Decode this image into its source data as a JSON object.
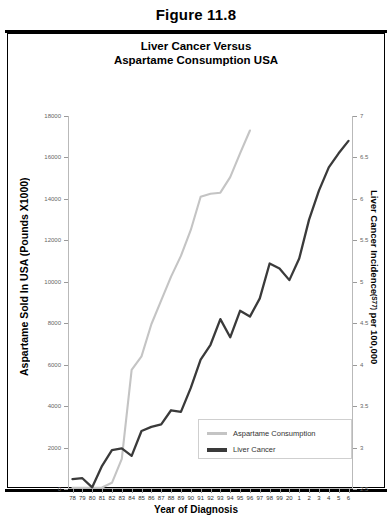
{
  "figure": {
    "number_label": "Figure 11.8"
  },
  "chart_data": {
    "type": "line",
    "title": "Liver Cancer Versus\nAspartame Consumption USA",
    "title_line1": "Liver Cancer Versus",
    "title_line2": "Aspartame Consumption USA",
    "xlabel": "Year of Diagnosis",
    "ylabel_left": "Aspartame Sold In USA (Pounds X1000)",
    "ylabel_right_main": "Liver Cancer Incidence",
    "ylabel_right_sub": "(S77)",
    "ylabel_right_tail": " per 100,000",
    "grid": false,
    "legend_position": "inside-bottom-right",
    "categories": [
      "78",
      "79",
      "80",
      "81",
      "82",
      "83",
      "84",
      "85",
      "86",
      "87",
      "88",
      "89",
      "90",
      "91",
      "92",
      "93",
      "94",
      "95",
      "96",
      "97",
      "98",
      "99",
      "20",
      "1",
      "2",
      "3",
      "4",
      "5",
      "6"
    ],
    "x_tick_labels": [
      "78",
      "79",
      "80",
      "81",
      "82",
      "83",
      "84",
      "85",
      "86",
      "87",
      "88",
      "89",
      "90",
      "91",
      "92",
      "93",
      "94",
      "95",
      "96",
      "97",
      "98",
      "99",
      "20",
      "1",
      "2",
      "3",
      "4",
      "5",
      "6"
    ],
    "y_left_ticks": [
      "0",
      "2000",
      "4000",
      "6000",
      "8000",
      "10000",
      "12000",
      "14000",
      "16000",
      "18000"
    ],
    "y_left_lim": [
      0,
      18000
    ],
    "y_right_ticks": [
      "2.5",
      "3",
      "3.5",
      "4",
      "4.5",
      "5",
      "5.5",
      "6",
      "6.5",
      "7"
    ],
    "y_right_lim": [
      2.5,
      7
    ],
    "series": [
      {
        "name": "Aspartame Consumption",
        "color": "#c4c4c4",
        "axis": "left",
        "values": [
          60,
          60,
          60,
          70,
          300,
          1450,
          5750,
          6400,
          7950,
          9100,
          10250,
          11250,
          12500,
          14100,
          14250,
          14300,
          15050,
          16200,
          17300,
          null,
          null,
          null,
          null,
          null,
          null,
          null,
          null,
          null,
          null
        ]
      },
      {
        "name": "Liver Cancer",
        "color": "#3a3a3a",
        "axis": "right",
        "values": [
          2.62,
          2.63,
          2.52,
          2.78,
          2.97,
          2.99,
          2.9,
          3.2,
          3.25,
          3.28,
          3.45,
          3.43,
          3.72,
          4.06,
          4.24,
          4.55,
          4.33,
          4.65,
          4.58,
          4.8,
          5.22,
          5.16,
          5.02,
          5.28,
          5.75,
          6.1,
          6.38,
          6.55,
          6.7
        ]
      }
    ]
  },
  "legend": {
    "items": [
      {
        "label": "Aspartame Consumption",
        "color": "#c4c4c4"
      },
      {
        "label": "Liver Cancer",
        "color": "#3a3a3a"
      }
    ]
  }
}
